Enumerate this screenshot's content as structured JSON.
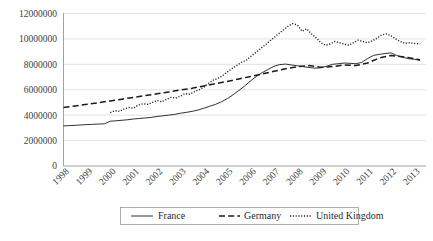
{
  "chart_data": {
    "type": "line",
    "title": "",
    "xlabel": "",
    "ylabel": "",
    "grid": true,
    "legend_position": "bottom",
    "ylim": [
      0,
      12000000
    ],
    "yticks": [
      0,
      2000000,
      4000000,
      6000000,
      8000000,
      10000000,
      12000000
    ],
    "ytick_labels": [
      "0",
      "2000000",
      "4000000",
      "6000000",
      "8000000",
      "10000000",
      "12000000"
    ],
    "xlim": [
      1998,
      2013.5
    ],
    "categories": [
      "1998",
      "1999",
      "2000",
      "2001",
      "2002",
      "2003",
      "2004",
      "2005",
      "2006",
      "2007",
      "2008",
      "2009",
      "2010",
      "2011",
      "2012",
      "2013"
    ],
    "series": [
      {
        "name": "France",
        "style": "solid",
        "color": "#1a1a1a",
        "x": [
          1998.0,
          1998.25,
          1998.5,
          1998.75,
          1999.0,
          1999.25,
          1999.5,
          1999.75,
          2000.0,
          2000.25,
          2000.5,
          2000.75,
          2001.0,
          2001.25,
          2001.5,
          2001.75,
          2002.0,
          2002.25,
          2002.5,
          2002.75,
          2003.0,
          2003.25,
          2003.5,
          2003.75,
          2004.0,
          2004.25,
          2004.5,
          2004.75,
          2005.0,
          2005.25,
          2005.5,
          2005.75,
          2006.0,
          2006.25,
          2006.5,
          2006.75,
          2007.0,
          2007.25,
          2007.5,
          2007.75,
          2008.0,
          2008.25,
          2008.5,
          2008.75,
          2009.0,
          2009.25,
          2009.5,
          2009.75,
          2010.0,
          2010.25,
          2010.5,
          2010.75,
          2011.0,
          2011.25,
          2011.5,
          2011.75,
          2012.0,
          2012.25,
          2012.5,
          2012.75,
          2013.0,
          2013.25
        ],
        "values": [
          3150000,
          3180000,
          3200000,
          3230000,
          3260000,
          3280000,
          3300000,
          3320000,
          3520000,
          3560000,
          3600000,
          3640000,
          3700000,
          3740000,
          3780000,
          3820000,
          3900000,
          3950000,
          4000000,
          4060000,
          4150000,
          4220000,
          4300000,
          4400000,
          4550000,
          4700000,
          4850000,
          5050000,
          5300000,
          5600000,
          5950000,
          6300000,
          6700000,
          7050000,
          7350000,
          7600000,
          7850000,
          7980000,
          8020000,
          7950000,
          7880000,
          7820000,
          7750000,
          7700000,
          7720000,
          7850000,
          8000000,
          8050000,
          8100000,
          8080000,
          8050000,
          8150000,
          8450000,
          8700000,
          8780000,
          8850000,
          8900000,
          8700000,
          8550000,
          8450000,
          8400000,
          8300000
        ]
      },
      {
        "name": "Germany",
        "style": "dashed",
        "color": "#1a1a1a",
        "x": [
          1998.0,
          1998.5,
          1999.0,
          1999.5,
          2000.0,
          2000.5,
          2001.0,
          2001.5,
          2002.0,
          2002.5,
          2003.0,
          2003.5,
          2004.0,
          2004.5,
          2005.0,
          2005.5,
          2006.0,
          2006.5,
          2007.0,
          2007.5,
          2008.0,
          2008.5,
          2009.0,
          2009.5,
          2010.0,
          2010.5,
          2011.0,
          2011.5,
          2012.0,
          2012.5,
          2013.0,
          2013.25
        ],
        "values": [
          4600000,
          4720000,
          4850000,
          4980000,
          5120000,
          5260000,
          5400000,
          5540000,
          5680000,
          5820000,
          5980000,
          6120000,
          6300000,
          6480000,
          6650000,
          6850000,
          7050000,
          7250000,
          7450000,
          7650000,
          7820000,
          7900000,
          7780000,
          7820000,
          7950000,
          7900000,
          8100000,
          8500000,
          8700000,
          8600000,
          8450000,
          8350000
        ]
      },
      {
        "name": "United Kingdom",
        "style": "dotted",
        "color": "#1a1a1a",
        "x": [
          2000.0,
          2000.2,
          2000.4,
          2000.6,
          2000.8,
          2001.0,
          2001.2,
          2001.4,
          2001.6,
          2001.8,
          2002.0,
          2002.2,
          2002.4,
          2002.6,
          2002.8,
          2003.0,
          2003.2,
          2003.4,
          2003.6,
          2003.8,
          2004.0,
          2004.2,
          2004.4,
          2004.6,
          2004.8,
          2005.0,
          2005.2,
          2005.4,
          2005.6,
          2005.8,
          2006.0,
          2006.2,
          2006.4,
          2006.6,
          2006.8,
          2007.0,
          2007.2,
          2007.4,
          2007.6,
          2007.8,
          2008.0,
          2008.2,
          2008.4,
          2008.6,
          2008.8,
          2009.0,
          2009.2,
          2009.4,
          2009.6,
          2009.8,
          2010.0,
          2010.2,
          2010.4,
          2010.6,
          2010.8,
          2011.0,
          2011.2,
          2011.4,
          2011.6,
          2011.8,
          2012.0,
          2012.2,
          2012.4,
          2012.6,
          2012.8,
          2013.0,
          2013.25
        ],
        "values": [
          4200000,
          4350000,
          4300000,
          4500000,
          4600000,
          4550000,
          4800000,
          4900000,
          4850000,
          5000000,
          5150000,
          5050000,
          5250000,
          5400000,
          5350000,
          5500000,
          5700000,
          5650000,
          5850000,
          6000000,
          6200000,
          6500000,
          6750000,
          6900000,
          7100000,
          7400000,
          7650000,
          7900000,
          8150000,
          8300000,
          8600000,
          8900000,
          9200000,
          9500000,
          9800000,
          10100000,
          10400000,
          10700000,
          11000000,
          11200000,
          11100000,
          10600000,
          10800000,
          10400000,
          10100000,
          9700000,
          9500000,
          9600000,
          9800000,
          9700000,
          9600000,
          9500000,
          9700000,
          9900000,
          9800000,
          9700000,
          9850000,
          10050000,
          10300000,
          10400000,
          10250000,
          10000000,
          9800000,
          9650000,
          9700000,
          9650000,
          9600000
        ]
      }
    ]
  },
  "legend": {
    "items": [
      {
        "label": "France",
        "style": "solid"
      },
      {
        "label": "Germany",
        "style": "dashed"
      },
      {
        "label": "United Kingdom",
        "style": "dotted"
      }
    ]
  }
}
